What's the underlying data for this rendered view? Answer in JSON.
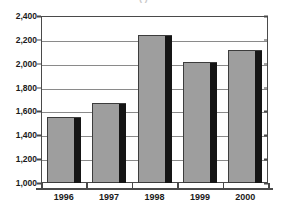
{
  "chart_data": {
    "type": "bar",
    "title": "(     )",
    "subtitle": "",
    "xlabel": "",
    "ylabel": "",
    "categories": [
      "1996",
      "1997",
      "1998",
      "1999",
      "2000"
    ],
    "values": [
      1550,
      1670,
      2245,
      2015,
      2115
    ],
    "series": [
      {
        "name": "",
        "values": [
          1550,
          1670,
          2245,
          2015,
          2115
        ]
      }
    ],
    "ylim": [
      1000,
      2400
    ],
    "ytick_step": 200,
    "ytick_labels": [
      "1,000",
      "1,200",
      "1,400",
      "1,600",
      "1,800",
      "2,000",
      "2,200",
      "2,400"
    ],
    "ytick_values": [
      1000,
      1200,
      1400,
      1600,
      1800,
      2000,
      2200,
      2400
    ],
    "xtick_labels": [
      "1996",
      "1997",
      "1998",
      "1999",
      "2000"
    ],
    "grid": true,
    "grid_axis": "y",
    "legend": false,
    "legend_position": "none",
    "bar_color": "#9e9e9e",
    "bar_shadow_color": "#151515",
    "bar_border_color": "#3c3c3c",
    "axis_color": "#4a4a4a",
    "gridline_color": "#8a8a8a",
    "background_color": "#ffffff",
    "text_color": "#1a1a1a"
  }
}
